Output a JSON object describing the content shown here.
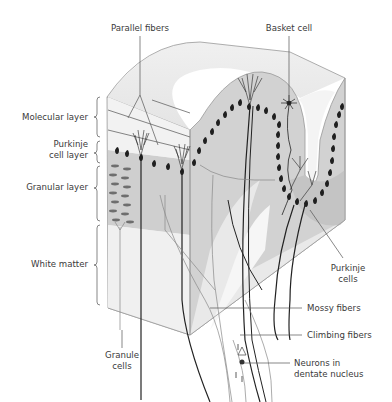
{
  "figure": {
    "colors": {
      "tissue_gray": "#c8c8c8",
      "light_gray": "#e6e6e6",
      "line": "#555555",
      "cell": "#222222",
      "label_text": "#3a3a3a"
    }
  },
  "labels": {
    "parallel_fibers": "Parallel fibers",
    "basket_cell": "Basket cell",
    "molecular_layer": "Molecular layer",
    "purkinje_cell_layer_1": "Purkinje",
    "purkinje_cell_layer_2": "cell layer",
    "granular_layer": "Granular layer",
    "white_matter": "White matter",
    "purkinje_cells_1": "Purkinje",
    "purkinje_cells_2": "cells",
    "mossy_fibers": "Mossy fibers",
    "climbing_fibers": "Climbing fibers",
    "neurons_dentate_1": "Neurons in",
    "neurons_dentate_2": "dentate nucleus",
    "granule_cells_1": "Granule",
    "granule_cells_2": "cells"
  }
}
